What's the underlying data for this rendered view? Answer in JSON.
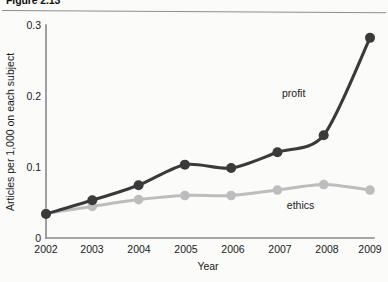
{
  "figure": {
    "number": "Figure 2.13",
    "caption": "(title clipped at top edge)"
  },
  "chart_data": {
    "type": "line",
    "title": "",
    "xlabel": "Year",
    "ylabel": "Articles per 1,000 on each subject",
    "categories": [
      "2002",
      "2003",
      "2004",
      "2005",
      "2006",
      "2007",
      "2008",
      "2009"
    ],
    "x": [
      2002,
      2003,
      2004,
      2005,
      2006,
      2007,
      2008,
      2009
    ],
    "xlim": [
      2002,
      2009
    ],
    "ylim": [
      0,
      0.31
    ],
    "yticks": [
      "0",
      "0.1",
      "0.2",
      "0.3"
    ],
    "ytick_values": [
      0,
      0.1,
      0.2,
      0.3
    ],
    "grid": false,
    "legend": "inline-labels",
    "series": [
      {
        "name": "profit",
        "color": "#3a3a3a",
        "values": [
          0.035,
          0.055,
          0.077,
          0.107,
          0.102,
          0.125,
          0.15,
          0.292
        ],
        "label_x": 2007.35,
        "label_y": 0.205
      },
      {
        "name": "ethics",
        "color": "#bdbdbd",
        "values": [
          0.036,
          0.046,
          0.056,
          0.062,
          0.062,
          0.07,
          0.078,
          0.07
        ],
        "label_x": 2007.5,
        "label_y": 0.043
      }
    ]
  },
  "labels": {
    "y_axis": "Articles per 1,000 on each subject",
    "x_axis": "Year",
    "ytick_0": "0",
    "ytick_1": "0.1",
    "ytick_2": "0.2",
    "ytick_3": "0.3",
    "xtick_2002": "2002",
    "xtick_2003": "2003",
    "xtick_2004": "2004",
    "xtick_2005": "2005",
    "xtick_2006": "2006",
    "xtick_2007": "2007",
    "xtick_2008": "2008",
    "xtick_2009": "2009",
    "series_profit": "profit",
    "series_ethics": "ethics"
  }
}
